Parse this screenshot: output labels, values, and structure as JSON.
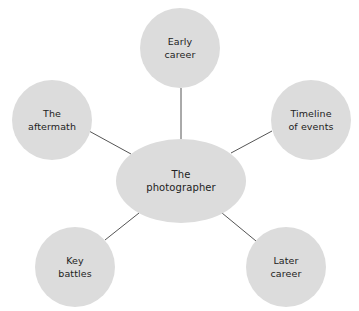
{
  "diagram": {
    "type": "mind-map",
    "colors": {
      "background": "#ffffff",
      "node_fill": "#dcdcdc",
      "line": "#555555",
      "text": "#222222"
    },
    "center": {
      "label": "The\nphotographer",
      "cx": 181,
      "cy": 181,
      "rx": 65,
      "ry": 42
    },
    "nodes": [
      {
        "id": "early-career",
        "label": "Early\ncareer",
        "cx": 180,
        "cy": 48,
        "r": 40
      },
      {
        "id": "the-aftermath",
        "label": "The\naftermath",
        "cx": 52,
        "cy": 120,
        "r": 40
      },
      {
        "id": "timeline-of-events",
        "label": "Timeline\nof events",
        "cx": 311,
        "cy": 120,
        "r": 40
      },
      {
        "id": "key-battles",
        "label": "Key\nbattles",
        "cx": 75,
        "cy": 267,
        "r": 40
      },
      {
        "id": "later-career",
        "label": "Later\ncareer",
        "cx": 286,
        "cy": 267,
        "r": 40
      }
    ],
    "links": [
      {
        "from": "center",
        "to": "early-career",
        "x1": 181,
        "y1": 139,
        "x2": 181,
        "y2": 88
      },
      {
        "from": "center",
        "to": "the-aftermath",
        "x1": 131,
        "y1": 154,
        "x2": 89,
        "y2": 131
      },
      {
        "from": "center",
        "to": "timeline-of-events",
        "x1": 231,
        "y1": 153,
        "x2": 272,
        "y2": 131
      },
      {
        "from": "center",
        "to": "key-battles",
        "x1": 139,
        "y1": 213,
        "x2": 105,
        "y2": 240
      },
      {
        "from": "center",
        "to": "later-career",
        "x1": 222,
        "y1": 213,
        "x2": 256,
        "y2": 241
      }
    ]
  }
}
